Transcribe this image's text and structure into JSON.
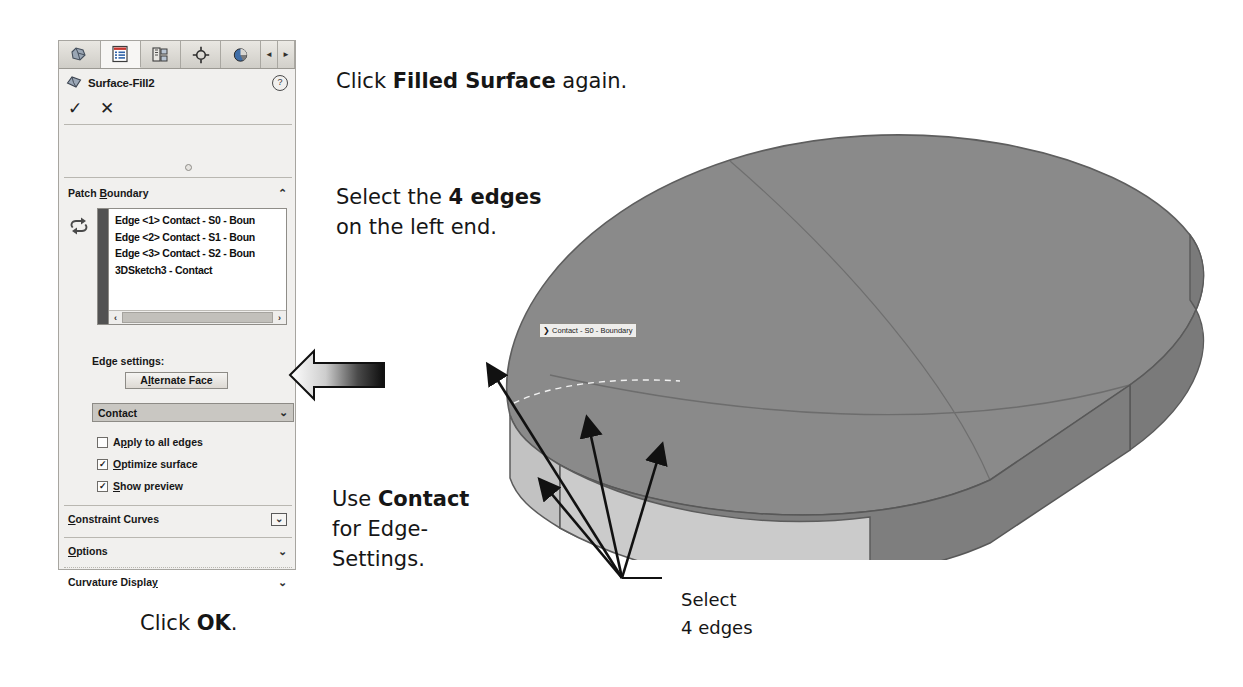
{
  "panel": {
    "tabs": [
      {
        "name": "feature-manager-tree",
        "icon": "tree-icon"
      },
      {
        "name": "property-manager",
        "icon": "property-list-icon",
        "active": true
      },
      {
        "name": "configuration-manager",
        "icon": "configuration-icon"
      },
      {
        "name": "dimxpert-manager",
        "icon": "dimxpert-target-icon"
      },
      {
        "name": "display-manager",
        "icon": "appearances-sphere-icon"
      }
    ],
    "nav_prev_label": "◄",
    "nav_next_label": "►",
    "feature_title": "Surface-Fill2",
    "help_label": "?",
    "ok_glyph": "✓",
    "cancel_glyph": "✕",
    "patch_boundary": {
      "title_pre": "Patch ",
      "title_underlined": "B",
      "title_post": "oundary",
      "chevron": "⌃",
      "items": [
        "Edge <1> Contact - S0 - Boun",
        "Edge <2> Contact - S1 - Boun",
        "Edge <3> Contact - S2 - Boun",
        "3DSketch3 - Contact"
      ],
      "scroll_left": "‹",
      "scroll_right": "›"
    },
    "edge_settings": {
      "label": "Edge settings:",
      "alternate_face_pre": "A",
      "alternate_face_underlined": "l",
      "alternate_face_post": "ternate Face",
      "combo_value": "Contact",
      "combo_chevron": "⌄",
      "checkboxes": [
        {
          "label_pre": "A",
          "label_u": "p",
          "label_post": "ply to all edges",
          "checked": false,
          "check_glyph": ""
        },
        {
          "label_pre": "",
          "label_u": "O",
          "label_post": "ptimize surface",
          "checked": true,
          "check_glyph": "✓"
        },
        {
          "label_pre": "",
          "label_u": "S",
          "label_post": "how preview",
          "checked": true,
          "check_glyph": "✓"
        }
      ]
    },
    "sections": [
      {
        "pre": "",
        "u": "C",
        "post": "onstraint Curves",
        "chevron": "⌄",
        "boxed": true
      },
      {
        "pre": "",
        "u": "O",
        "post": "ptions",
        "chevron": "⌄",
        "boxed": false
      },
      {
        "pre": "Curvature Displa",
        "u": "y",
        "post": "",
        "chevron": "⌄",
        "boxed": false
      }
    ]
  },
  "annotations": {
    "filled_surface": {
      "pre": "Click ",
      "bold": "Filled Surface",
      "post": " again."
    },
    "four_edges_l1": {
      "pre": "Select the ",
      "bold": "4 edges",
      "post": ""
    },
    "four_edges_l2": "on the left end.",
    "use_contact_l1": {
      "pre": "Use ",
      "bold": "Contact",
      "post": ""
    },
    "use_contact_l2": "for Edge-",
    "use_contact_l3": "Settings.",
    "click_ok": {
      "pre": "Click ",
      "bold": "OK",
      "post": "."
    },
    "select_label_l1": "Select",
    "select_label_l2": "4 edges"
  },
  "model": {
    "callout_text": "❯ Contact - S0 - Boundary",
    "top_face_color": "#8a8a8a",
    "side_face_color": "#7e7e7e",
    "end_face_color": "#bdbdbd"
  }
}
